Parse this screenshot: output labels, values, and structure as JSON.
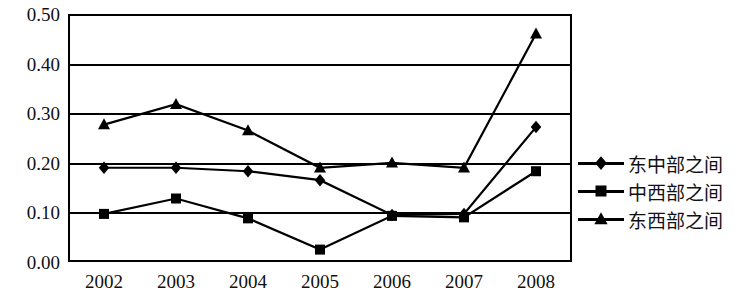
{
  "chart_data": {
    "type": "line",
    "title": "",
    "xlabel": "",
    "ylabel": "",
    "categories": [
      "2002",
      "2003",
      "2004",
      "2005",
      "2006",
      "2007",
      "2008"
    ],
    "ylim": [
      0.0,
      0.5
    ],
    "ytick_labels": [
      "0.50",
      "0.40",
      "0.30",
      "0.20",
      "0.10",
      "0.00"
    ],
    "ytick_values": [
      0.5,
      0.4,
      0.3,
      0.2,
      0.1,
      0.0
    ],
    "grid": true,
    "legend_position": "right",
    "series": [
      {
        "name": "东中部之间",
        "marker": "diamond",
        "values": [
          0.19,
          0.19,
          0.183,
          0.165,
          0.095,
          0.097,
          0.272
        ]
      },
      {
        "name": "中西部之间",
        "marker": "square",
        "values": [
          0.097,
          0.128,
          0.088,
          0.025,
          0.093,
          0.09,
          0.183
        ]
      },
      {
        "name": "东西部之间",
        "marker": "triangle",
        "values": [
          0.277,
          0.318,
          0.265,
          0.19,
          0.2,
          0.19,
          0.46
        ]
      }
    ]
  },
  "legend": {
    "items": [
      {
        "label": "东中部之间",
        "marker": "diamond"
      },
      {
        "label": "中西部之间",
        "marker": "square"
      },
      {
        "label": "东西部之间",
        "marker": "triangle"
      }
    ]
  },
  "colors": {
    "line": "#000000",
    "marker": "#000000",
    "grid": "#000000",
    "background": "#ffffff",
    "text": "#111111"
  }
}
